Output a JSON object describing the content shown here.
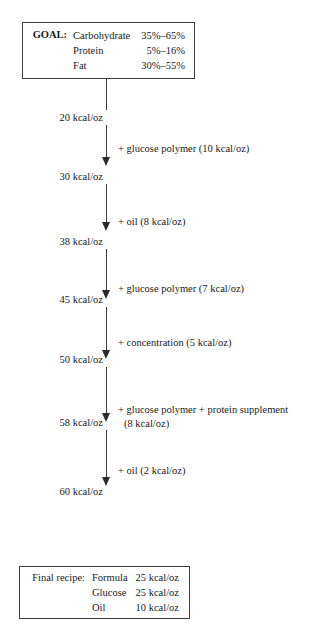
{
  "goal_box": {
    "label": "GOAL:",
    "rows": [
      {
        "nutrient": "Carbohydrate",
        "range": "35%–65%"
      },
      {
        "nutrient": "Protein",
        "range": "5%–16%"
      },
      {
        "nutrient": "Fat",
        "range": "30%–55%"
      }
    ]
  },
  "flow": {
    "nodes": [
      {
        "label": "20 kcal/oz"
      },
      {
        "label": "30 kcal/oz"
      },
      {
        "label": "38 kcal/oz"
      },
      {
        "label": "45 kcal/oz"
      },
      {
        "label": "50 kcal/oz"
      },
      {
        "label": "58 kcal/oz"
      },
      {
        "label": "60 kcal/oz"
      }
    ],
    "edges": [
      {
        "line1": "+ glucose polymer (10 kcal/oz)",
        "line2": ""
      },
      {
        "line1": "+ oil (8 kcal/oz)",
        "line2": ""
      },
      {
        "line1": "+ glucose polymer (7 kcal/oz)",
        "line2": ""
      },
      {
        "line1": "+ concentration (5 kcal/oz)",
        "line2": ""
      },
      {
        "line1": "+ glucose polymer + protein supplement",
        "line2": "(8 kcal/oz)"
      },
      {
        "line1": "+ oil (2 kcal/oz)",
        "line2": ""
      }
    ]
  },
  "final_box": {
    "label": "Final recipe:",
    "rows": [
      {
        "item": "Formula",
        "amount": "25 kcal/oz"
      },
      {
        "item": "Glucose",
        "amount": "25 kcal/oz"
      },
      {
        "item": "Oil",
        "amount": "10 kcal/oz"
      }
    ]
  }
}
